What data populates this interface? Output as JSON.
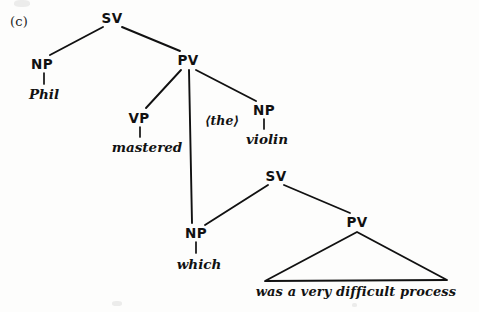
{
  "figure": {
    "label": "(c)",
    "ink_color": "#111111",
    "paper_color": "#fdfdfc"
  },
  "tree": {
    "nodes": [
      {
        "id": "sv-root",
        "label": "SV",
        "x": 112,
        "y": 18
      },
      {
        "id": "np-phil",
        "label": "NP",
        "x": 42,
        "y": 64
      },
      {
        "id": "pv-main",
        "label": "PV",
        "x": 188,
        "y": 60
      },
      {
        "id": "vp-mastered",
        "label": "VP",
        "x": 139,
        "y": 118
      },
      {
        "id": "np-violin",
        "label": "NP",
        "x": 264,
        "y": 110
      },
      {
        "id": "np-which",
        "label": "NP",
        "x": 196,
        "y": 233
      },
      {
        "id": "sv-lower",
        "label": "SV",
        "x": 276,
        "y": 176
      },
      {
        "id": "pv-lower",
        "label": "PV",
        "x": 357,
        "y": 222
      }
    ],
    "terminals": [
      {
        "id": "phil",
        "text": "Phil",
        "x": 44,
        "y": 94
      },
      {
        "id": "mastered",
        "text": "mastered",
        "x": 147,
        "y": 147
      },
      {
        "id": "violin",
        "text": "violin",
        "x": 267,
        "y": 139
      },
      {
        "id": "which",
        "text": "which",
        "x": 199,
        "y": 264
      },
      {
        "id": "process",
        "text": "was a very difficult process",
        "x": 356,
        "y": 291
      }
    ],
    "annotations": [
      {
        "id": "the-bracketed",
        "text": "⟨the⟩",
        "x": 222,
        "y": 120
      }
    ],
    "branches": [
      {
        "id": "svroot-to-npphil",
        "x1": 103,
        "y1": 27,
        "x2": 50,
        "y2": 55
      },
      {
        "id": "svroot-to-pvmain",
        "x1": 122,
        "y1": 27,
        "x2": 180,
        "y2": 51
      },
      {
        "id": "pvmain-to-vpmastered",
        "x1": 181,
        "y1": 70,
        "x2": 146,
        "y2": 108
      },
      {
        "id": "pvmain-to-npwhich",
        "x1": 189,
        "y1": 70,
        "x2": 192,
        "y2": 223
      },
      {
        "id": "pvmain-to-npviolin",
        "x1": 196,
        "y1": 70,
        "x2": 256,
        "y2": 101
      },
      {
        "id": "svlower-to-npwhich",
        "x1": 268,
        "y1": 185,
        "x2": 205,
        "y2": 225
      },
      {
        "id": "svlower-to-pvlower",
        "x1": 284,
        "y1": 185,
        "x2": 350,
        "y2": 213
      }
    ],
    "stems": [
      {
        "id": "stem-np-phil",
        "x1": 44,
        "y1": 73,
        "x2": 44,
        "y2": 84
      },
      {
        "id": "stem-vp-mastered",
        "x1": 140,
        "y1": 127,
        "x2": 140,
        "y2": 137
      },
      {
        "id": "stem-np-violin",
        "x1": 264,
        "y1": 119,
        "x2": 264,
        "y2": 129
      },
      {
        "id": "stem-np-which",
        "x1": 196,
        "y1": 242,
        "x2": 196,
        "y2": 253
      }
    ],
    "triangle": {
      "id": "pv-lower-triangle",
      "apex_x": 357,
      "apex_y": 232,
      "left_x": 265,
      "left_y": 281,
      "right_x": 447,
      "right_y": 280
    }
  }
}
